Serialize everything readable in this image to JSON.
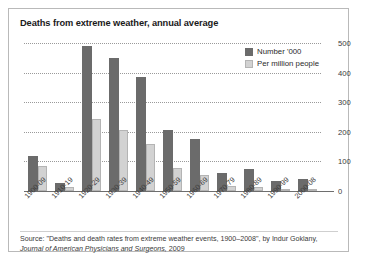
{
  "chart_data": {
    "type": "bar",
    "title": "Deaths from extreme weather, annual average",
    "xlabel": "",
    "ylabel": "",
    "ylim": [
      0,
      500
    ],
    "yticks": [
      0,
      100,
      200,
      300,
      400,
      500
    ],
    "grid": true,
    "legend_position": "top-right",
    "categories": [
      "1900-09",
      "1910-19",
      "1920-29",
      "1930-39",
      "1940-49",
      "1950-59",
      "1960-69",
      "1970-79",
      "1980-89",
      "1990-99",
      "2000-08"
    ],
    "series": [
      {
        "name": "Number '000",
        "color": "#6b6b6b",
        "values": [
          118,
          28,
          490,
          450,
          385,
          205,
          175,
          60,
          75,
          35,
          40
        ]
      },
      {
        "name": "Per million people",
        "color": "#d2d2d2",
        "values": [
          83,
          12,
          242,
          207,
          160,
          77,
          55,
          16,
          15,
          6,
          7
        ]
      }
    ],
    "source": "Source: \"Deaths and death rates from extreme weather events, 1900–2008\", by Indur Goklany,",
    "source_italic": "Journal of American Physicians and Surgeons,",
    "source_tail": " 2009"
  }
}
